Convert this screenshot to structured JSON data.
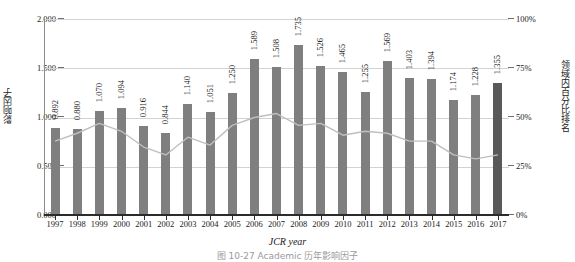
{
  "chart_data": {
    "type": "bar",
    "title": "",
    "xlabel": "JCR year",
    "ylabel": "影响因子",
    "y2label": "领域内百分比排名",
    "categories": [
      "1997",
      "1998",
      "1999",
      "2000",
      "2001",
      "2002",
      "2003",
      "2004",
      "2005",
      "2006",
      "2007",
      "2008",
      "2009",
      "2010",
      "2011",
      "2012",
      "2013",
      "2014",
      "2015",
      "2016",
      "2017"
    ],
    "ylim": [
      0,
      2.0
    ],
    "yticks": [
      "0.000",
      "0.500",
      "1.000",
      "1.500",
      "2.000"
    ],
    "ytick_values": [
      0,
      0.5,
      1.0,
      1.5,
      2.0
    ],
    "y2lim": [
      0,
      100
    ],
    "y2ticks": [
      "0%",
      "25%",
      "50%",
      "75%",
      "100%"
    ],
    "y2tick_values": [
      0,
      25,
      50,
      75,
      100
    ],
    "grid": true,
    "legend": "none",
    "series": [
      {
        "name": "影响因子",
        "type": "bar",
        "axis": "left",
        "color": "#7f7f7f",
        "highlight_color": "#595959",
        "highlight_index": 20,
        "values": [
          0.892,
          0.88,
          1.07,
          1.094,
          0.916,
          0.844,
          1.14,
          1.051,
          1.25,
          1.589,
          1.508,
          1.735,
          1.526,
          1.465,
          1.255,
          1.569,
          1.403,
          1.394,
          1.174,
          1.228,
          1.355
        ],
        "labels": [
          "0.892",
          "0.880",
          "1.070",
          "1.094",
          "0.916",
          "0.844",
          "1.140",
          "1.051",
          "1.250",
          "1.589",
          "1.508",
          "1.735",
          "1.526",
          "1.465",
          "1.255",
          "1.569",
          "1.403",
          "1.394",
          "1.174",
          "1.228",
          "1.355"
        ]
      },
      {
        "name": "领域内百分比排名",
        "type": "line",
        "axis": "right",
        "color": "#bfbfbf",
        "values": [
          38,
          42,
          47,
          43,
          35,
          31,
          40,
          36,
          46,
          50,
          52,
          46,
          47,
          41,
          43,
          42,
          38,
          38,
          31,
          29,
          31
        ]
      }
    ]
  },
  "caption": {
    "text": "图 10-27    Academic 历年影响因子"
  }
}
